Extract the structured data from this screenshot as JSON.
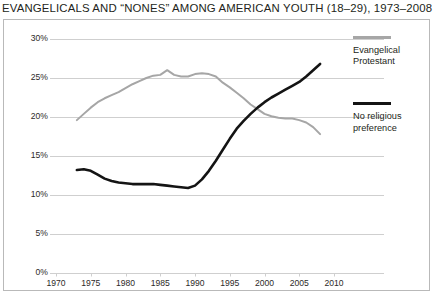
{
  "chart_data": {
    "type": "line",
    "title": "EVANGELICALS AND “NONES” AMONG AMERICAN YOUTH (18–29), 1973–2008",
    "xlabel": "",
    "ylabel": "",
    "xlim": [
      1970,
      2010
    ],
    "ylim": [
      0,
      30
    ],
    "grid": true,
    "grid_axis": "y",
    "legend_position": "right",
    "x_ticks": [
      "1970",
      "1975",
      "1980",
      "1985",
      "1990",
      "1995",
      "2000",
      "2005",
      "2010"
    ],
    "x_tick_values": [
      1970,
      1975,
      1980,
      1985,
      1990,
      1995,
      2000,
      2005,
      2010
    ],
    "y_ticks": [
      "0%",
      "5%",
      "10%",
      "15%",
      "20%",
      "25%",
      "30%"
    ],
    "y_tick_values": [
      0,
      5,
      10,
      15,
      20,
      25,
      30
    ],
    "x": [
      1973,
      1974,
      1975,
      1976,
      1977,
      1978,
      1979,
      1980,
      1981,
      1982,
      1983,
      1984,
      1985,
      1986,
      1987,
      1988,
      1989,
      1990,
      1991,
      1992,
      1993,
      1994,
      1995,
      1996,
      1997,
      1998,
      1999,
      2000,
      2001,
      2002,
      2003,
      2004,
      2005,
      2006,
      2007,
      2008
    ],
    "series": [
      {
        "name": "Evangelical Protestant",
        "color": "#a6a6a6",
        "values": [
          19.6,
          20.4,
          21.2,
          21.9,
          22.4,
          22.8,
          23.2,
          23.7,
          24.2,
          24.6,
          25.0,
          25.3,
          25.4,
          26.0,
          25.4,
          25.2,
          25.2,
          25.5,
          25.6,
          25.5,
          25.2,
          24.4,
          23.8,
          23.1,
          22.4,
          21.6,
          21.0,
          20.4,
          20.1,
          19.9,
          19.8,
          19.8,
          19.6,
          19.3,
          18.7,
          17.8
        ]
      },
      {
        "name": "No religious preference",
        "color": "#141414",
        "values": [
          13.2,
          13.3,
          13.1,
          12.6,
          12.1,
          11.8,
          11.6,
          11.5,
          11.4,
          11.4,
          11.4,
          11.4,
          11.3,
          11.2,
          11.1,
          11.0,
          10.9,
          11.2,
          12.0,
          13.1,
          14.4,
          15.8,
          17.2,
          18.5,
          19.5,
          20.4,
          21.2,
          21.9,
          22.5,
          23.0,
          23.5,
          24.0,
          24.5,
          25.2,
          26.0,
          26.8
        ]
      }
    ],
    "annotations": []
  },
  "legend": {
    "items": [
      {
        "label_line1": "Evangelical",
        "label_line2": "Protestant",
        "color": "#a6a6a6"
      },
      {
        "label_line1": "No religious",
        "label_line2": "preference",
        "color": "#141414"
      }
    ]
  }
}
